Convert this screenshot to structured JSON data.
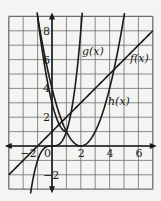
{
  "figure": {
    "grid": {
      "xmin": -3,
      "xmax": 7,
      "ymin": -3,
      "ymax": 9,
      "step": 1
    },
    "axis_tick_labels": {
      "x": [
        {
          "value": -2,
          "text": "−2"
        },
        {
          "value": 0,
          "text": "0"
        },
        {
          "value": 2,
          "text": "2"
        },
        {
          "value": 4,
          "text": "4"
        },
        {
          "value": 6,
          "text": "6"
        }
      ],
      "y": [
        {
          "value": 8,
          "text": "8"
        },
        {
          "value": 6,
          "text": "6"
        },
        {
          "value": 4,
          "text": "4"
        },
        {
          "value": 2,
          "text": "2"
        },
        {
          "value": -2,
          "text": "−2"
        }
      ]
    },
    "functions": [
      {
        "name": "f(x)",
        "label": "f(x)",
        "type": "line"
      },
      {
        "name": "g(x)",
        "label": "g(x)",
        "type": "curve"
      },
      {
        "name": "h(x)",
        "label": "h(x)",
        "type": "parabola"
      }
    ],
    "colors": {
      "background": "#f4f4f2",
      "grid": "#6e6e6e",
      "ink": "#1a1a1a"
    }
  }
}
